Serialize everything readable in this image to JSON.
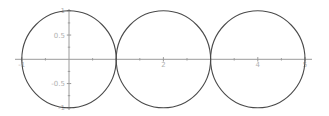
{
  "chart_data": {
    "type": "line",
    "title": "",
    "xlabel": "",
    "ylabel": "",
    "xlim": [
      -1,
      5
    ],
    "ylim": [
      -1,
      1
    ],
    "grid": false,
    "legend": null,
    "x_ticks_major": [
      {
        "value": -1,
        "label": "-1"
      },
      {
        "value": 2,
        "label": "2"
      },
      {
        "value": 4,
        "label": "4"
      },
      {
        "value": 5,
        "label": "5"
      }
    ],
    "x_ticks_minor": [
      -0.5,
      0.5,
      1,
      1.5,
      2.5,
      3,
      3.5,
      4.5
    ],
    "y_ticks_major": [
      {
        "value": 1,
        "label": "1"
      },
      {
        "value": 0.5,
        "label": "0.5"
      },
      {
        "value": -0.5,
        "label": "-0.5"
      },
      {
        "value": -1,
        "label": "-1"
      }
    ],
    "y_ticks_minor": [
      0.75,
      0.25,
      -0.25,
      -0.75
    ],
    "series": [
      {
        "name": "circle-1",
        "shape": "circle",
        "center": [
          0,
          0
        ],
        "radius": 1,
        "color": "#4a4a4a"
      },
      {
        "name": "circle-2",
        "shape": "circle",
        "center": [
          2,
          0
        ],
        "radius": 1,
        "color": "#4a4a4a"
      },
      {
        "name": "circle-3",
        "shape": "circle",
        "center": [
          4,
          0
        ],
        "radius": 1,
        "color": "#4a4a4a"
      }
    ]
  },
  "layout": {
    "origin_px": [
      69,
      59.3
    ],
    "px_per_unit_x": 47.2,
    "px_per_unit_y": 48.5,
    "x_axis_px": [
      15,
      312
    ],
    "y_axis_px": [
      9,
      110
    ],
    "axis_color": "#9a9a9a",
    "label_color": "#b0b0b0"
  }
}
